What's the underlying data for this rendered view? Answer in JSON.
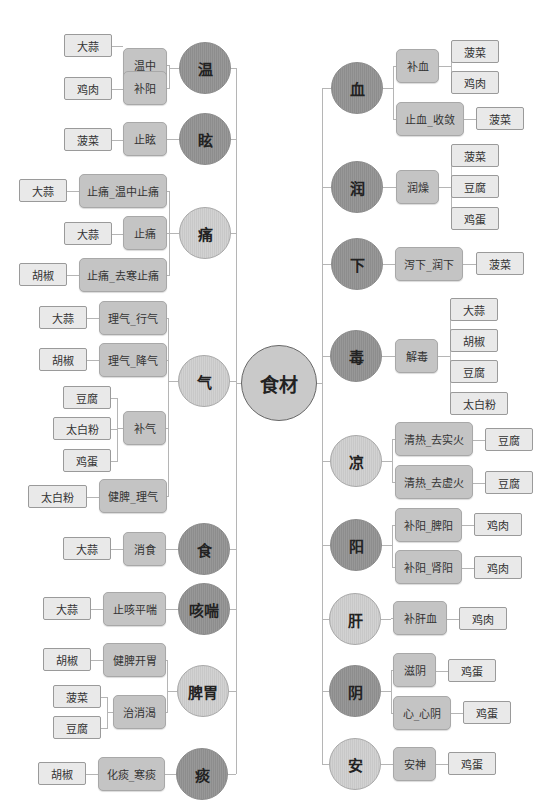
{
  "root": {
    "label": "食材"
  },
  "colors": {
    "dark_circle": "#929292",
    "light_circle": "#cdcdcd",
    "mid_box": "#c4c4c4",
    "leaf_box": "#e9e9e9",
    "line": "#b5b5b5"
  },
  "left": [
    {
      "id": "wen",
      "label": "温",
      "tone": "dark",
      "cx": 205,
      "cy": 68,
      "r": 26,
      "items": [
        {
          "label": "温中",
          "x": 123,
          "y": 48,
          "w": 44,
          "h": 34,
          "leaves": [
            {
              "label": "大蒜",
              "x": 64,
              "y": 34,
              "w": 48,
              "h": 23
            }
          ]
        },
        {
          "label": "补阳",
          "x": 123,
          "y": 71,
          "w": 44,
          "h": 34,
          "leaves": [
            {
              "label": "鸡肉",
              "x": 64,
              "y": 77,
              "w": 48,
              "h": 23
            }
          ]
        }
      ]
    },
    {
      "id": "xuan",
      "label": "眩",
      "tone": "dark",
      "cx": 205,
      "cy": 139,
      "r": 26,
      "items": [
        {
          "label": "止眩",
          "x": 123,
          "y": 122,
          "w": 44,
          "h": 34,
          "leaves": [
            {
              "label": "菠菜",
              "x": 64,
              "y": 128,
              "w": 48,
              "h": 23
            }
          ]
        }
      ]
    },
    {
      "id": "tong",
      "label": "痛",
      "tone": "light",
      "cx": 205,
      "cy": 233,
      "r": 26,
      "items": [
        {
          "label": "止痛_温中止痛",
          "x": 79,
          "y": 174,
          "w": 88,
          "h": 34,
          "leaves": [
            {
              "label": "大蒜",
              "x": 19,
              "y": 179,
              "w": 48,
              "h": 23
            }
          ]
        },
        {
          "label": "止痛",
          "x": 123,
          "y": 216,
          "w": 44,
          "h": 34,
          "leaves": [
            {
              "label": "大蒜",
              "x": 64,
              "y": 222,
              "w": 48,
              "h": 23
            }
          ]
        },
        {
          "label": "止痛_去寒止痛",
          "x": 79,
          "y": 258,
          "w": 88,
          "h": 34,
          "leaves": [
            {
              "label": "胡椒",
              "x": 19,
              "y": 263,
              "w": 48,
              "h": 23
            }
          ]
        }
      ]
    },
    {
      "id": "qi",
      "label": "气",
      "tone": "light",
      "cx": 204,
      "cy": 381,
      "r": 26,
      "items": [
        {
          "label": "理气_行气",
          "x": 99,
          "y": 301,
          "w": 68,
          "h": 34,
          "leaves": [
            {
              "label": "大蒜",
              "x": 39,
              "y": 306,
              "w": 48,
              "h": 23
            }
          ]
        },
        {
          "label": "理气_降气",
          "x": 99,
          "y": 343,
          "w": 68,
          "h": 34,
          "leaves": [
            {
              "label": "胡椒",
              "x": 39,
              "y": 348,
              "w": 48,
              "h": 23
            }
          ]
        },
        {
          "label": "补气",
          "x": 123,
          "y": 411,
          "w": 43,
          "h": 34,
          "leaves": [
            {
              "label": "豆腐",
              "x": 63,
              "y": 386,
              "w": 48,
              "h": 23
            },
            {
              "label": "太白粉",
              "x": 53,
              "y": 417,
              "w": 58,
              "h": 23
            },
            {
              "label": "鸡蛋",
              "x": 63,
              "y": 449,
              "w": 48,
              "h": 23
            }
          ]
        },
        {
          "label": "健脾_理气",
          "x": 99,
          "y": 479,
          "w": 68,
          "h": 34,
          "leaves": [
            {
              "label": "太白粉",
              "x": 28,
              "y": 485,
              "w": 59,
              "h": 23
            }
          ]
        }
      ]
    },
    {
      "id": "shi",
      "label": "食",
      "tone": "dark",
      "cx": 204,
      "cy": 549,
      "r": 26,
      "items": [
        {
          "label": "消食",
          "x": 123,
          "y": 532,
          "w": 43,
          "h": 34,
          "leaves": [
            {
              "label": "大蒜",
              "x": 63,
              "y": 537,
              "w": 48,
              "h": 23
            }
          ]
        }
      ]
    },
    {
      "id": "kechuan",
      "label": "咳喘",
      "tone": "dark",
      "cx": 204,
      "cy": 609,
      "r": 26,
      "items": [
        {
          "label": "止咳平喘",
          "x": 103,
          "y": 592,
          "w": 63,
          "h": 34,
          "leaves": [
            {
              "label": "大蒜",
              "x": 43,
              "y": 597,
              "w": 48,
              "h": 23
            }
          ]
        }
      ]
    },
    {
      "id": "piwei",
      "label": "脾胃",
      "tone": "light",
      "cx": 203,
      "cy": 691,
      "r": 26,
      "items": [
        {
          "label": "健脾开胃",
          "x": 103,
          "y": 643,
          "w": 63,
          "h": 34,
          "leaves": [
            {
              "label": "胡椒",
              "x": 43,
              "y": 648,
              "w": 48,
              "h": 23
            }
          ]
        },
        {
          "label": "治消渴",
          "x": 113,
          "y": 695,
          "w": 53,
          "h": 34,
          "leaves": [
            {
              "label": "菠菜",
              "x": 53,
              "y": 685,
              "w": 48,
              "h": 23
            },
            {
              "label": "豆腐",
              "x": 53,
              "y": 716,
              "w": 48,
              "h": 23
            }
          ]
        }
      ]
    },
    {
      "id": "tan",
      "label": "痰",
      "tone": "dark",
      "cx": 202,
      "cy": 774,
      "r": 26,
      "items": [
        {
          "label": "化痰_寒痰",
          "x": 98,
          "y": 757,
          "w": 67,
          "h": 34,
          "leaves": [
            {
              "label": "胡椒",
              "x": 38,
              "y": 762,
              "w": 48,
              "h": 23
            }
          ]
        }
      ]
    }
  ],
  "right": [
    {
      "id": "xue",
      "label": "血",
      "tone": "dark",
      "cx": 357,
      "cy": 88,
      "r": 26,
      "items": [
        {
          "label": "补血",
          "x": 396,
          "y": 49,
          "w": 43,
          "h": 34,
          "leaves": [
            {
              "label": "菠菜",
              "x": 451,
              "y": 40,
              "w": 48,
              "h": 23
            },
            {
              "label": "鸡肉",
              "x": 451,
              "y": 71,
              "w": 48,
              "h": 23
            }
          ]
        },
        {
          "label": "止血_收敛",
          "x": 396,
          "y": 102,
          "w": 68,
          "h": 34,
          "leaves": [
            {
              "label": "菠菜",
              "x": 476,
              "y": 107,
              "w": 48,
              "h": 23
            }
          ]
        }
      ]
    },
    {
      "id": "run",
      "label": "润",
      "tone": "dark",
      "cx": 357,
      "cy": 187,
      "r": 26,
      "items": [
        {
          "label": "润燥",
          "x": 396,
          "y": 170,
          "w": 43,
          "h": 34,
          "leaves": [
            {
              "label": "菠菜",
              "x": 451,
              "y": 144,
              "w": 48,
              "h": 23
            },
            {
              "label": "豆腐",
              "x": 451,
              "y": 175,
              "w": 48,
              "h": 23
            },
            {
              "label": "鸡蛋",
              "x": 451,
              "y": 207,
              "w": 48,
              "h": 23
            }
          ]
        }
      ]
    },
    {
      "id": "xia",
      "label": "下",
      "tone": "dark",
      "cx": 357,
      "cy": 264,
      "r": 26,
      "items": [
        {
          "label": "泻下_润下",
          "x": 395,
          "y": 247,
          "w": 68,
          "h": 34,
          "leaves": [
            {
              "label": "菠菜",
              "x": 476,
              "y": 252,
              "w": 48,
              "h": 23
            }
          ]
        }
      ]
    },
    {
      "id": "du",
      "label": "毒",
      "tone": "dark",
      "cx": 356,
      "cy": 356,
      "r": 26,
      "items": [
        {
          "label": "解毒",
          "x": 395,
          "y": 339,
          "w": 43,
          "h": 34,
          "leaves": [
            {
              "label": "大蒜",
              "x": 450,
              "y": 298,
              "w": 48,
              "h": 23
            },
            {
              "label": "胡椒",
              "x": 450,
              "y": 329,
              "w": 48,
              "h": 23
            },
            {
              "label": "豆腐",
              "x": 450,
              "y": 360,
              "w": 48,
              "h": 23
            },
            {
              "label": "太白粉",
              "x": 450,
              "y": 392,
              "w": 58,
              "h": 23
            }
          ]
        }
      ]
    },
    {
      "id": "liang",
      "label": "凉",
      "tone": "light",
      "cx": 356,
      "cy": 461,
      "r": 26,
      "items": [
        {
          "label": "清热_去实火",
          "x": 395,
          "y": 422,
          "w": 78,
          "h": 34,
          "leaves": [
            {
              "label": "豆腐",
              "x": 485,
              "y": 428,
              "w": 48,
              "h": 23
            }
          ]
        },
        {
          "label": "清热_去虚火",
          "x": 395,
          "y": 465,
          "w": 78,
          "h": 34,
          "leaves": [
            {
              "label": "豆腐",
              "x": 485,
              "y": 471,
              "w": 48,
              "h": 23
            }
          ]
        }
      ]
    },
    {
      "id": "yang",
      "label": "阳",
      "tone": "dark",
      "cx": 356,
      "cy": 545,
      "r": 26,
      "items": [
        {
          "label": "补阳_脾阳",
          "x": 395,
          "y": 508,
          "w": 67,
          "h": 34,
          "leaves": [
            {
              "label": "鸡肉",
              "x": 474,
              "y": 513,
              "w": 48,
              "h": 23
            }
          ]
        },
        {
          "label": "补阳_肾阳",
          "x": 395,
          "y": 550,
          "w": 67,
          "h": 34,
          "leaves": [
            {
              "label": "鸡肉",
              "x": 474,
              "y": 556,
              "w": 48,
              "h": 23
            }
          ]
        }
      ]
    },
    {
      "id": "gan",
      "label": "肝",
      "tone": "light",
      "cx": 355,
      "cy": 619,
      "r": 26,
      "items": [
        {
          "label": "补肝血",
          "x": 393,
          "y": 601,
          "w": 54,
          "h": 34,
          "leaves": [
            {
              "label": "鸡肉",
              "x": 459,
              "y": 607,
              "w": 48,
              "h": 23
            }
          ]
        }
      ]
    },
    {
      "id": "yin",
      "label": "阴",
      "tone": "dark",
      "cx": 355,
      "cy": 691,
      "r": 26,
      "items": [
        {
          "label": "滋阴",
          "x": 393,
          "y": 653,
          "w": 43,
          "h": 34,
          "leaves": [
            {
              "label": "鸡蛋",
              "x": 448,
              "y": 659,
              "w": 48,
              "h": 23
            }
          ]
        },
        {
          "label": "心_心阴",
          "x": 393,
          "y": 696,
          "w": 58,
          "h": 34,
          "leaves": [
            {
              "label": "鸡蛋",
              "x": 463,
              "y": 701,
              "w": 48,
              "h": 23
            }
          ]
        }
      ]
    },
    {
      "id": "an",
      "label": "安",
      "tone": "light",
      "cx": 355,
      "cy": 764,
      "r": 26,
      "items": [
        {
          "label": "安神",
          "x": 393,
          "y": 747,
          "w": 43,
          "h": 34,
          "leaves": [
            {
              "label": "鸡蛋",
              "x": 448,
              "y": 752,
              "w": 48,
              "h": 23
            }
          ]
        }
      ]
    }
  ]
}
